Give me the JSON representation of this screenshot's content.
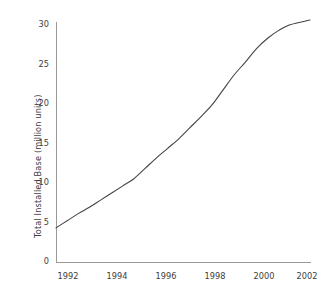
{
  "chart_data": {
    "type": "line",
    "title": "",
    "subtitle": "",
    "xlabel": "",
    "ylabel": "Total Installed Base (million units)",
    "xlim": [
      1991.5,
      2002.9
    ],
    "ylim": [
      0,
      30
    ],
    "grid": false,
    "legend": null,
    "xticks": [
      1992,
      1994,
      1996,
      1998,
      2000,
      2002
    ],
    "xtick_labels": [
      "1992",
      "1994",
      "1996",
      "1998",
      "2000",
      "2002"
    ],
    "yticks": [
      0,
      5,
      10,
      15,
      20,
      25,
      30
    ],
    "ytick_labels": [
      "0",
      "5",
      "10",
      "15",
      "20",
      "25",
      "30"
    ],
    "line_color": "#444444",
    "axis_color": "#999999",
    "background": "#ffffff",
    "series": [
      {
        "name": "Total Installed Base",
        "x": [
          1991.5,
          1992,
          1992.5,
          1993,
          1993.5,
          1994,
          1994.5,
          1995,
          1995.5,
          1996,
          1996.5,
          1997,
          1997.5,
          1998,
          1998.5,
          1999,
          1999.5,
          2000,
          2000.5,
          2001,
          2001.5,
          2002,
          2002.9
        ],
        "values": [
          4.3,
          5.2,
          6.1,
          6.9,
          7.8,
          8.7,
          9.6,
          10.5,
          11.8,
          13.1,
          14.3,
          15.5,
          16.9,
          18.3,
          19.8,
          21.7,
          23.6,
          25.2,
          26.9,
          28.2,
          29.2,
          29.9,
          30.5
        ]
      }
    ]
  },
  "geometry": {
    "plot_left": 56,
    "plot_right": 310,
    "plot_top": 24,
    "plot_bottom": 262
  },
  "axis_labels": {
    "y_axis_title": "Total Installed Base (million units)"
  }
}
